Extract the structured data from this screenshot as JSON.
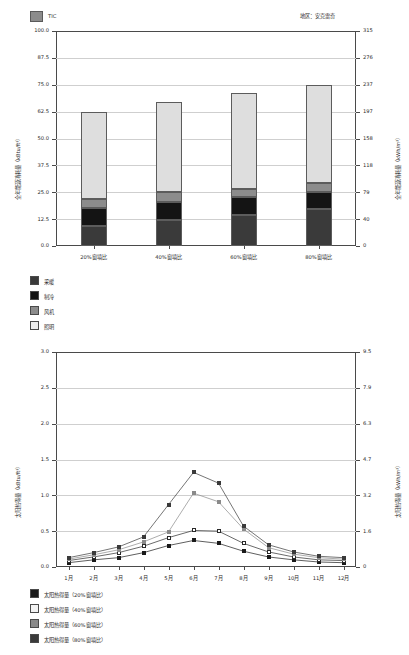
{
  "header": {
    "legend_swatch_label": "TIC",
    "legend_swatch_color": "#8c8c8c",
    "region_label": "地区：安克雷奇"
  },
  "top_chart": {
    "left_axis": {
      "label": "全年能源消耗量（kBtu/ft²）",
      "ticks": [
        "100.0",
        "87.5",
        "75.0",
        "62.5",
        "50.0",
        "37.5",
        "25.0",
        "12.5",
        "0.0"
      ],
      "min": 0,
      "max": 100
    },
    "right_axis": {
      "label": "全年能源消耗量（kWh/m²）",
      "ticks": [
        "315",
        "276",
        "237",
        "197",
        "158",
        "118",
        "79",
        "40",
        "0"
      ],
      "min": 0,
      "max": 315
    },
    "categories": [
      "20%窗墙比",
      "40%窗墙比",
      "60%窗墙比",
      "80%窗墙比"
    ],
    "series": [
      {
        "name": "采暖",
        "color": "#3a3a3a",
        "values": [
          9.5,
          12.0,
          14.5,
          17.0
        ]
      },
      {
        "name": "制冷",
        "color": "#141414",
        "values": [
          8.0,
          8.5,
          8.5,
          8.0
        ]
      },
      {
        "name": "风机",
        "color": "#8c8c8c",
        "values": [
          4.5,
          4.5,
          3.5,
          4.5
        ]
      },
      {
        "name": "照明",
        "color": "#dedede",
        "values": [
          40.5,
          42.0,
          44.5,
          45.5
        ]
      }
    ],
    "totals": [
      62.5,
      67.0,
      71.0,
      75.0
    ]
  },
  "middle_legend": [
    {
      "label": "采暖",
      "color": "#3a3a3a"
    },
    {
      "label": "制冷",
      "color": "#141414"
    },
    {
      "label": "风机",
      "color": "#8c8c8c"
    },
    {
      "label": "照明",
      "color": "#ededed"
    }
  ],
  "bottom_chart": {
    "left_axis": {
      "label": "太阳热得量（kBtu/ft²）",
      "ticks": [
        "3.0",
        "2.5",
        "2.0",
        "1.5",
        "1.0",
        "0.5",
        "0.0"
      ],
      "min": 0,
      "max": 3.0
    },
    "right_axis": {
      "label": "太阳热得量（kWh/m²）",
      "ticks": [
        "9.5",
        "7.9",
        "6.3",
        "4.7",
        "3.2",
        "1.6",
        "0"
      ],
      "min": 0,
      "max": 9.5
    },
    "categories": [
      "1月",
      "2月",
      "3月",
      "4月",
      "5月",
      "6月",
      "7月",
      "8月",
      "9月",
      "10月",
      "11月",
      "12月"
    ],
    "series": [
      {
        "name": "太阳热得量（20%窗墙比）",
        "color": "#1a1a1a",
        "fill": "#1a1a1a",
        "values": [
          0.06,
          0.1,
          0.13,
          0.2,
          0.3,
          0.37,
          0.33,
          0.22,
          0.14,
          0.1,
          0.07,
          0.06
        ]
      },
      {
        "name": "太阳热得量（40%窗墙比）",
        "color": "#2a2a2a",
        "fill": "#ffffff",
        "values": [
          0.09,
          0.14,
          0.2,
          0.29,
          0.41,
          0.51,
          0.5,
          0.33,
          0.21,
          0.14,
          0.1,
          0.09
        ]
      },
      {
        "name": "太阳热得量（60%窗墙比）",
        "color": "#8a8a8a",
        "fill": "#8a8a8a",
        "values": [
          0.11,
          0.17,
          0.24,
          0.35,
          0.49,
          1.03,
          0.91,
          0.53,
          0.27,
          0.18,
          0.13,
          0.11
        ]
      },
      {
        "name": "太阳热得量（80%窗墙比）",
        "color": "#3a3a3a",
        "fill": "#3a3a3a",
        "values": [
          0.13,
          0.2,
          0.28,
          0.42,
          0.87,
          1.32,
          1.17,
          0.57,
          0.31,
          0.21,
          0.15,
          0.13
        ]
      }
    ]
  },
  "bottom_legend": [
    {
      "label": "太阳热得量（20%窗墙比）",
      "color": "#1a1a1a"
    },
    {
      "label": "太阳热得量（40%窗墙比）",
      "color": "#f2f2f2"
    },
    {
      "label": "太阳热得量（60%窗墙比）",
      "color": "#8a8a8a"
    },
    {
      "label": "太阳热得量（80%窗墙比）",
      "color": "#3a3a3a"
    }
  ],
  "chart_data": [
    {
      "type": "bar",
      "title": "全年能源消耗量",
      "stacked": true,
      "categories": [
        "20%窗墙比",
        "40%窗墙比",
        "60%窗墙比",
        "80%窗墙比"
      ],
      "series": [
        {
          "name": "采暖",
          "values": [
            9.5,
            12.0,
            14.5,
            17.0
          ]
        },
        {
          "name": "制冷",
          "values": [
            8.0,
            8.5,
            8.5,
            8.0
          ]
        },
        {
          "name": "风机",
          "values": [
            4.5,
            4.5,
            3.5,
            4.5
          ]
        },
        {
          "name": "照明",
          "values": [
            40.5,
            42.0,
            44.5,
            45.5
          ]
        }
      ],
      "xlabel": "",
      "ylabel": "全年能源消耗量（kBtu/ft²）",
      "y2label": "全年能源消耗量（kWh/m²）",
      "ylim": [
        0,
        100
      ],
      "y2lim": [
        0,
        315
      ],
      "yticks": [
        0,
        12.5,
        25,
        37.5,
        50,
        62.5,
        75,
        87.5,
        100
      ],
      "y2ticks": [
        0,
        40,
        79,
        118,
        158,
        197,
        237,
        276,
        315
      ],
      "grid": true,
      "legend": [
        "采暖",
        "制冷",
        "风机",
        "照明"
      ],
      "legend_position": "below-left"
    },
    {
      "type": "line",
      "title": "太阳热得量",
      "x": [
        "1月",
        "2月",
        "3月",
        "4月",
        "5月",
        "6月",
        "7月",
        "8月",
        "9月",
        "10月",
        "11月",
        "12月"
      ],
      "series": [
        {
          "name": "太阳热得量（20%窗墙比）",
          "values": [
            0.06,
            0.1,
            0.13,
            0.2,
            0.3,
            0.37,
            0.33,
            0.22,
            0.14,
            0.1,
            0.07,
            0.06
          ]
        },
        {
          "name": "太阳热得量（40%窗墙比）",
          "values": [
            0.09,
            0.14,
            0.2,
            0.29,
            0.41,
            0.51,
            0.5,
            0.33,
            0.21,
            0.14,
            0.1,
            0.09
          ]
        },
        {
          "name": "太阳热得量（60%窗墙比）",
          "values": [
            0.11,
            0.17,
            0.24,
            0.35,
            0.49,
            1.03,
            0.91,
            0.53,
            0.27,
            0.18,
            0.13,
            0.11
          ]
        },
        {
          "name": "太阳热得量（80%窗墙比）",
          "values": [
            0.13,
            0.2,
            0.28,
            0.42,
            0.87,
            1.32,
            1.17,
            0.57,
            0.31,
            0.21,
            0.15,
            0.13
          ]
        }
      ],
      "xlabel": "",
      "ylabel": "太阳热得量（kBtu/ft²）",
      "y2label": "太阳热得量（kWh/m²）",
      "ylim": [
        0,
        3.0
      ],
      "y2lim": [
        0,
        9.5
      ],
      "yticks": [
        0,
        0.5,
        1.0,
        1.5,
        2.0,
        2.5,
        3.0
      ],
      "y2ticks": [
        0,
        1.6,
        3.2,
        4.7,
        6.3,
        7.9,
        9.5
      ],
      "grid": true,
      "legend_position": "below-left"
    }
  ]
}
